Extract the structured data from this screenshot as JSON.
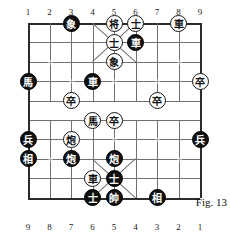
{
  "figure": {
    "caption": "Fig. 13"
  },
  "board": {
    "files_top": [
      "1",
      "2",
      "3",
      "4",
      "5",
      "6",
      "7",
      "8",
      "9"
    ],
    "files_bottom": [
      "9",
      "8",
      "7",
      "6",
      "5",
      "4",
      "3",
      "2",
      "1"
    ],
    "columns": 9,
    "rows": 10,
    "grid_color": "#6f6f6f",
    "edge_color": "#2b2b2b",
    "background": "#ffffff"
  },
  "pieces": [
    {
      "name": "black-elephant",
      "glyph": "象",
      "color": "black",
      "col": 3,
      "row": 1
    },
    {
      "name": "black-general",
      "glyph": "将",
      "color": "white",
      "col": 5,
      "row": 1
    },
    {
      "name": "advisor-6-1",
      "glyph": "士",
      "color": "white",
      "col": 6,
      "row": 1
    },
    {
      "name": "white-chariot-8",
      "glyph": "車",
      "color": "white",
      "col": 8,
      "row": 1
    },
    {
      "name": "advisor-5-2",
      "glyph": "士",
      "color": "white",
      "col": 5,
      "row": 2
    },
    {
      "name": "black-chariot-6",
      "glyph": "車",
      "color": "black",
      "col": 6,
      "row": 2
    },
    {
      "name": "white-elephant-5",
      "glyph": "象",
      "color": "white",
      "col": 5,
      "row": 3
    },
    {
      "name": "black-horse-1",
      "glyph": "馬",
      "color": "black",
      "col": 1,
      "row": 4
    },
    {
      "name": "black-chariot-4",
      "glyph": "車",
      "color": "black",
      "col": 4,
      "row": 4
    },
    {
      "name": "white-pawn-9",
      "glyph": "卒",
      "color": "white",
      "col": 9,
      "row": 4
    },
    {
      "name": "white-pawn-3",
      "glyph": "卒",
      "color": "white",
      "col": 3,
      "row": 5
    },
    {
      "name": "white-pawn-7",
      "glyph": "卒",
      "color": "white",
      "col": 7,
      "row": 5
    },
    {
      "name": "white-horse-4",
      "glyph": "馬",
      "color": "white",
      "col": 4,
      "row": 6
    },
    {
      "name": "white-pawn-5",
      "glyph": "卒",
      "color": "white",
      "col": 5,
      "row": 6
    },
    {
      "name": "black-soldier-1",
      "glyph": "兵",
      "color": "black",
      "col": 1,
      "row": 7
    },
    {
      "name": "white-cannon-3",
      "glyph": "炮",
      "color": "white",
      "col": 3,
      "row": 7
    },
    {
      "name": "black-soldier-9",
      "glyph": "兵",
      "color": "black",
      "col": 9,
      "row": 7
    },
    {
      "name": "black-minister-1",
      "glyph": "相",
      "color": "black",
      "col": 1,
      "row": 8
    },
    {
      "name": "black-cannon-3",
      "glyph": "炮",
      "color": "black",
      "col": 3,
      "row": 8
    },
    {
      "name": "black-cannon-5",
      "glyph": "炮",
      "color": "black",
      "col": 5,
      "row": 8
    },
    {
      "name": "white-chariot-4",
      "glyph": "車",
      "color": "white",
      "col": 4,
      "row": 9
    },
    {
      "name": "black-advisor-5",
      "glyph": "士",
      "color": "black",
      "col": 5,
      "row": 9
    },
    {
      "name": "black-advisor-4",
      "glyph": "士",
      "color": "black",
      "col": 4,
      "row": 10
    },
    {
      "name": "black-marshal-5",
      "glyph": "帥",
      "color": "black",
      "col": 5,
      "row": 10
    },
    {
      "name": "black-minister-7",
      "glyph": "相",
      "color": "black",
      "col": 7,
      "row": 10
    }
  ]
}
